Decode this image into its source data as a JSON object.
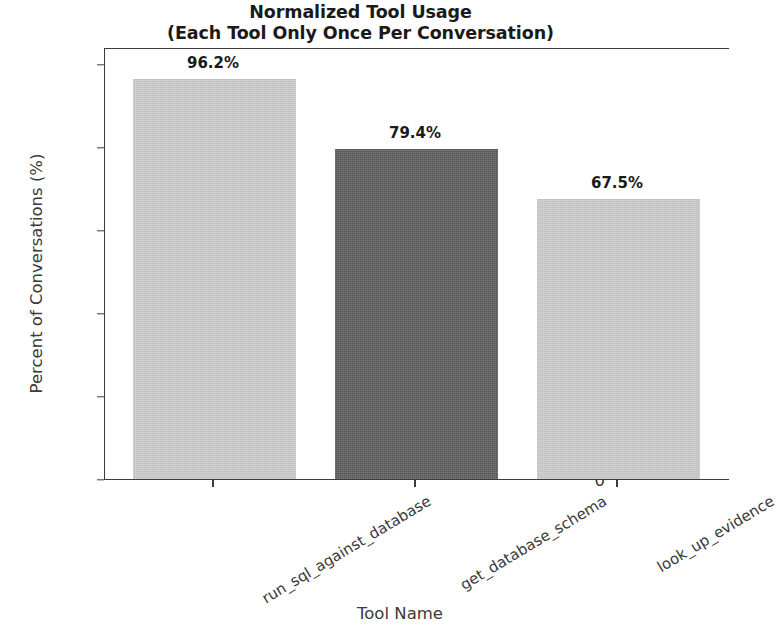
{
  "chart_data": {
    "type": "bar",
    "title": "Normalized Tool Usage\n(Each Tool Only Once Per Conversation)",
    "title_line1": "Normalized Tool Usage",
    "title_line2": "(Each Tool Only Once Per Conversation)",
    "xlabel": "Tool Name",
    "ylabel": "Percent of Conversations (%)",
    "categories": [
      "run_sql_against_database",
      "get_database_schema",
      "look_up_evidence"
    ],
    "values": [
      96.2,
      79.4,
      67.5
    ],
    "value_labels": [
      "96.2%",
      "79.4%",
      "67.5%"
    ],
    "bar_colors": [
      "#c9c9c9",
      "#595959",
      "#c9c9c9"
    ],
    "ylim": [
      0,
      104
    ],
    "yticks": [
      0,
      20,
      40,
      60,
      80,
      100
    ],
    "ytick_labels": [
      "0",
      "20",
      "40",
      "60",
      "80",
      "100"
    ],
    "grid": false,
    "legend": "none",
    "axis_color": "#3c3c3c",
    "text_color": "#3a3a3a"
  }
}
